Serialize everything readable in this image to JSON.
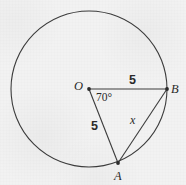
{
  "figure": {
    "type": "geometry-diagram",
    "background_color": "#f2f2f2",
    "stroke_color": "#3a3a3a",
    "text_color": "#2a2a2a"
  },
  "circle": {
    "center_label": "O",
    "cx": 89,
    "cy": 89,
    "r": 78
  },
  "points": [
    {
      "name": "center-point-o",
      "label": "O",
      "x": 89,
      "y": 89
    },
    {
      "name": "point-b",
      "label": "B",
      "x": 167,
      "y": 89
    },
    {
      "name": "point-a",
      "label": "A",
      "x": 118,
      "y": 163
    }
  ],
  "segments": [
    {
      "name": "radius-ob",
      "from": "O",
      "to": "B",
      "length_label": "5"
    },
    {
      "name": "radius-oa",
      "from": "O",
      "to": "A",
      "length_label": "5"
    },
    {
      "name": "chord-ab",
      "from": "A",
      "to": "B",
      "length_label": "x"
    }
  ],
  "angle": {
    "vertex": "O",
    "label": "70°",
    "value": 70,
    "unit": "degrees"
  },
  "labels": {
    "point_o": "O",
    "point_b": "B",
    "point_a": "A",
    "radius_ob": "5",
    "radius_oa": "5",
    "chord_ab": "x",
    "angle_aob": "70°"
  }
}
